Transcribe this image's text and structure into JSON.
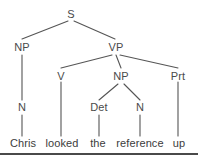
{
  "figure": {
    "kind": "constituency-syntax-tree",
    "sentence": "Chris looked the reference up",
    "line_color": "#555555",
    "text_color": "#3c3c3c",
    "background_color": "#ffffff",
    "rule_color": "#4a4a4a",
    "width": 198,
    "height": 160
  },
  "nodes": {
    "s": {
      "label": "S",
      "x": 71,
      "y": 14
    },
    "np_subject": {
      "label": "NP",
      "x": 22,
      "y": 47
    },
    "vp": {
      "label": "VP",
      "x": 116,
      "y": 47
    },
    "n_subject": {
      "label": "N",
      "x": 22,
      "y": 107
    },
    "v": {
      "label": "V",
      "x": 61,
      "y": 76
    },
    "np_object": {
      "label": "NP",
      "x": 121,
      "y": 76
    },
    "prt": {
      "label": "Prt",
      "x": 178,
      "y": 76
    },
    "det": {
      "label": "Det",
      "x": 99,
      "y": 107
    },
    "n_object": {
      "label": "N",
      "x": 140,
      "y": 107
    }
  },
  "leaves": [
    {
      "label": "Chris",
      "x": 23,
      "y": 143
    },
    {
      "label": "looked",
      "x": 62,
      "y": 143
    },
    {
      "label": "the",
      "x": 98,
      "y": 143
    },
    {
      "label": "reference",
      "x": 140,
      "y": 143
    },
    {
      "label": "up",
      "x": 179,
      "y": 143
    }
  ],
  "edges": [
    {
      "name": "s-to-np-subject",
      "x1": 68,
      "y1": 21,
      "x2": 22,
      "y2": 39
    },
    {
      "name": "s-to-vp",
      "x1": 74,
      "y1": 21,
      "x2": 115,
      "y2": 39
    },
    {
      "name": "np-subject-to-n",
      "x1": 22,
      "y1": 55,
      "x2": 22,
      "y2": 100
    },
    {
      "name": "n-subject-to-chris",
      "x1": 22,
      "y1": 115,
      "x2": 22,
      "y2": 136
    },
    {
      "name": "vp-to-v",
      "x1": 112,
      "y1": 55,
      "x2": 61,
      "y2": 68
    },
    {
      "name": "vp-to-np-object",
      "x1": 116,
      "y1": 55,
      "x2": 121,
      "y2": 68
    },
    {
      "name": "vp-to-prt",
      "x1": 120,
      "y1": 55,
      "x2": 178,
      "y2": 68
    },
    {
      "name": "v-to-looked",
      "x1": 61,
      "y1": 82,
      "x2": 61,
      "y2": 136
    },
    {
      "name": "np-object-to-det",
      "x1": 118,
      "y1": 84,
      "x2": 99,
      "y2": 100
    },
    {
      "name": "np-object-to-n",
      "x1": 124,
      "y1": 84,
      "x2": 140,
      "y2": 100
    },
    {
      "name": "det-to-the",
      "x1": 99,
      "y1": 115,
      "x2": 99,
      "y2": 136
    },
    {
      "name": "n-object-to-reference",
      "x1": 140,
      "y1": 115,
      "x2": 140,
      "y2": 136
    },
    {
      "name": "prt-to-up",
      "x1": 178,
      "y1": 82,
      "x2": 178,
      "y2": 136
    }
  ],
  "baseline_rule": {
    "y": 153
  }
}
